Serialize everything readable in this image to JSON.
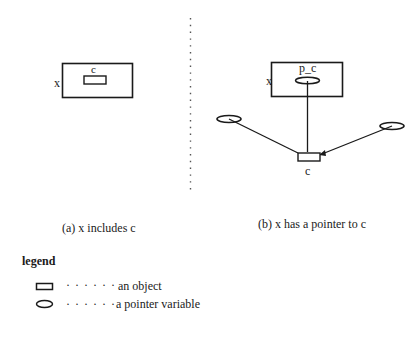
{
  "panel_a": {
    "outer_label": "x",
    "inner_label": "c",
    "caption": "(a) x includes c"
  },
  "panel_b": {
    "outer_label": "x",
    "pointer_label": "p_c",
    "target_label": "c",
    "caption": "(b) x has a pointer to c",
    "external_pointers": 2
  },
  "legend": {
    "title": "legend",
    "items": [
      {
        "icon": "rectangle-icon",
        "dots": "· · · · · ·",
        "label": "an object"
      },
      {
        "icon": "ellipse-icon",
        "dots": "· · · · · ·",
        "label": "a pointer variable"
      }
    ]
  },
  "colors": {
    "stroke": "#1a1a1a",
    "divider": "#555555"
  }
}
